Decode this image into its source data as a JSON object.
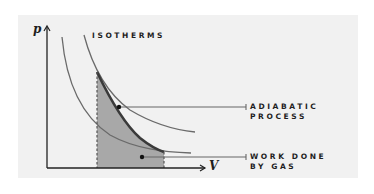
{
  "diagram": {
    "title_label": "ISOTHERMS",
    "axes": {
      "y_label": "p",
      "x_label": "V"
    },
    "callouts": [
      {
        "line1": "ADIABATIC",
        "line2": "PROCESS"
      },
      {
        "line1": "WORK DONE",
        "line2": "BY GAS"
      }
    ],
    "colors": {
      "panel_bg": "#f1f1f1",
      "shaded_area": "#a8a8a8",
      "adiabatic_curve": "#3a3a3a",
      "isotherm_curve": "#6a6a6a",
      "axis": "#222222",
      "leader_line": "#666666"
    }
  }
}
